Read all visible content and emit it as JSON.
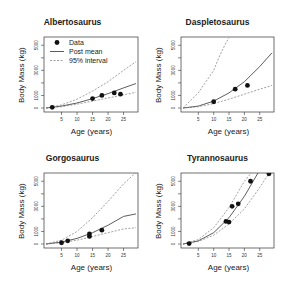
{
  "chart_data": [
    {
      "type": "scatter",
      "title": "Albertosaurus",
      "xlabel": "Age (years)",
      "ylabel": "Body Mass (kg)",
      "xlim": [
        0,
        29
      ],
      "ylim": [
        0,
        5500
      ],
      "xticks": [
        5,
        10,
        15,
        20,
        25
      ],
      "yticks": [
        0,
        1000,
        3000,
        5000
      ],
      "legend": [
        "Data",
        "Post mean",
        "95% interval"
      ],
      "points": [
        [
          2,
          50
        ],
        [
          15,
          750
        ],
        [
          18,
          1000
        ],
        [
          22,
          1200
        ],
        [
          24,
          1100
        ]
      ],
      "series": [
        {
          "name": "Post mean",
          "x": [
            0,
            5,
            10,
            15,
            20,
            25,
            29
          ],
          "values": [
            0,
            150,
            400,
            750,
            1150,
            1600,
            1950
          ]
        },
        {
          "name": "95% interval upper",
          "x": [
            0,
            5,
            10,
            15,
            20,
            25,
            29
          ],
          "values": [
            0,
            250,
            700,
            1350,
            2100,
            3000,
            3700
          ]
        },
        {
          "name": "95% interval lower",
          "x": [
            0,
            5,
            10,
            15,
            20,
            25,
            29
          ],
          "values": [
            0,
            100,
            300,
            550,
            800,
            1050,
            1250
          ]
        }
      ]
    },
    {
      "type": "scatter",
      "title": "Daspletosaurus",
      "xlabel": "Age (years)",
      "ylabel": "Body Mass (kg)",
      "xlim": [
        0,
        29
      ],
      "ylim": [
        0,
        5500
      ],
      "xticks": [
        5,
        10,
        15,
        20,
        25
      ],
      "yticks": [
        0,
        1000,
        3000,
        5000
      ],
      "points": [
        [
          10,
          500
        ],
        [
          17,
          1500
        ],
        [
          21,
          1800
        ]
      ],
      "series": [
        {
          "name": "Post mean",
          "x": [
            0,
            5,
            10,
            15,
            20,
            25,
            29
          ],
          "values": [
            0,
            150,
            550,
            1200,
            2100,
            3300,
            4400
          ]
        },
        {
          "name": "95% interval upper",
          "x": [
            0,
            5,
            10,
            12,
            14,
            15
          ],
          "values": [
            0,
            1200,
            3000,
            4200,
            5200,
            5600
          ]
        },
        {
          "name": "95% interval lower",
          "x": [
            0,
            5,
            10,
            15,
            20,
            25,
            29
          ],
          "values": [
            0,
            100,
            350,
            700,
            1100,
            1500,
            1800
          ]
        }
      ]
    },
    {
      "type": "scatter",
      "title": "Gorgosaurus",
      "xlabel": "Age (years)",
      "ylabel": "Body Mass (kg)",
      "xlim": [
        0,
        29
      ],
      "ylim": [
        0,
        5500
      ],
      "xticks": [
        5,
        10,
        15,
        20,
        25
      ],
      "yticks": [
        0,
        1000,
        3000,
        5000
      ],
      "points": [
        [
          5,
          100
        ],
        [
          7,
          250
        ],
        [
          14,
          600
        ],
        [
          14,
          800
        ],
        [
          18,
          1100
        ]
      ],
      "series": [
        {
          "name": "Post mean",
          "x": [
            0,
            5,
            10,
            15,
            20,
            25,
            29
          ],
          "values": [
            0,
            150,
            450,
            900,
            1500,
            2200,
            2400
          ]
        },
        {
          "name": "95% interval upper",
          "x": [
            0,
            5,
            10,
            15,
            20,
            25,
            29
          ],
          "values": [
            0,
            300,
            1000,
            2100,
            3400,
            4800,
            5700
          ]
        },
        {
          "name": "95% interval lower",
          "x": [
            0,
            5,
            10,
            15,
            20,
            25,
            29
          ],
          "values": [
            0,
            100,
            300,
            600,
            900,
            1200,
            1300
          ]
        }
      ]
    },
    {
      "type": "scatter",
      "title": "Tyrannosaurus",
      "xlabel": "Age (years)",
      "ylabel": "Body Mass (kg)",
      "xlim": [
        0,
        29
      ],
      "ylim": [
        0,
        5500
      ],
      "xticks": [
        5,
        10,
        15,
        20,
        25
      ],
      "yticks": [
        0,
        1000,
        3000,
        5000
      ],
      "points": [
        [
          2,
          30
        ],
        [
          14,
          1800
        ],
        [
          15,
          1750
        ],
        [
          16,
          3000
        ],
        [
          18,
          3200
        ],
        [
          22,
          5000
        ],
        [
          28,
          5600
        ]
      ],
      "series": [
        {
          "name": "Post mean",
          "x": [
            0,
            5,
            10,
            15,
            20,
            25
          ],
          "values": [
            0,
            250,
            900,
            2100,
            3800,
            5900
          ]
        },
        {
          "name": "95% interval upper",
          "x": [
            0,
            5,
            10,
            15,
            20,
            23
          ],
          "values": [
            0,
            350,
            1300,
            2900,
            5000,
            5900
          ]
        },
        {
          "name": "95% interval lower",
          "x": [
            0,
            5,
            10,
            15,
            20,
            25,
            28
          ],
          "values": [
            0,
            200,
            700,
            1600,
            2800,
            4500,
            5600
          ]
        }
      ]
    }
  ],
  "panels": [
    {
      "title": "Albertosaurus",
      "xlabel": "Age (years)",
      "ylabel": "Body Mass (kg)"
    },
    {
      "title": "Daspletosaurus",
      "xlabel": "Age (years)",
      "ylabel": "Body Mass (kg)"
    },
    {
      "title": "Gorgosaurus",
      "xlabel": "Age (years)",
      "ylabel": "Body Mass (kg)"
    },
    {
      "title": "Tyrannosaurus",
      "xlabel": "Age (years)",
      "ylabel": "Body Mass (kg)"
    }
  ],
  "legend": {
    "data": "Data",
    "mean": "Post mean",
    "interval": "95% interval"
  }
}
